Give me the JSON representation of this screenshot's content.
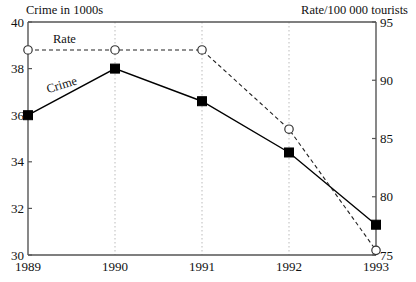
{
  "chart_data": {
    "type": "line",
    "title": "",
    "categories": [
      "1989",
      "1990",
      "1991",
      "1992",
      "1993"
    ],
    "series": [
      {
        "name": "Crime",
        "axis": "left",
        "marker": "filled-square",
        "line_style": "solid",
        "values": [
          36.0,
          38.0,
          36.6,
          34.4,
          31.3
        ]
      },
      {
        "name": "Rate",
        "axis": "right",
        "marker": "open-circle",
        "line_style": "dashed",
        "values": [
          92.6,
          92.6,
          92.6,
          85.8,
          75.4
        ]
      }
    ],
    "xlabel": "",
    "ylabel": "Crime in 1000s",
    "y2label": "Rate/100 000 tourists",
    "ylim": [
      30,
      40
    ],
    "y2lim": [
      75,
      95
    ],
    "yticks": [
      30,
      32,
      34,
      36,
      38,
      40
    ],
    "y2ticks": [
      75,
      80,
      85,
      90,
      95
    ],
    "grid": "vertical-dotted",
    "legend": "inline-labels"
  },
  "axes": {
    "left_title": "Crime in 1000s",
    "right_title": "Rate/100 000 tourists",
    "left_ticks": [
      "40",
      "38",
      "36",
      "34",
      "32",
      "30"
    ],
    "right_ticks": [
      "95",
      "90",
      "85",
      "80",
      "75"
    ],
    "x_ticks": [
      "1989",
      "1990",
      "1991",
      "1992",
      "1993"
    ]
  },
  "series_labels": {
    "rate": "Rate",
    "crime": "Crime"
  },
  "colors": {
    "axis": "#555555",
    "crime_line": "#000000",
    "rate_line": "#222222",
    "gridline": "#bbbbbb",
    "text": "#111111",
    "background": "#ffffff"
  }
}
